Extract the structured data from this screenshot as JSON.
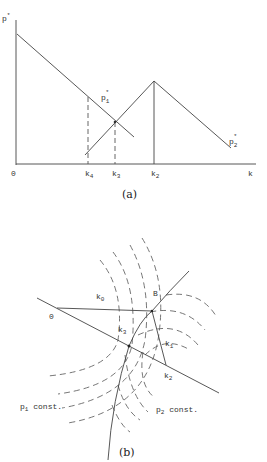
{
  "figure_a": {
    "caption": "(a)",
    "y_axis_label": "p",
    "y_axis_sup": "*",
    "origin_label": "0",
    "x_axis_label": "k",
    "curves": [
      {
        "name": "p1*",
        "label_base": "p",
        "label_sub": "1",
        "label_sup": "*"
      },
      {
        "name": "p2*",
        "label_base": "p",
        "label_sub": "2",
        "label_sup": "*"
      }
    ],
    "ticks": [
      {
        "base": "k",
        "sub": "4",
        "style": "dashed"
      },
      {
        "base": "k",
        "sub": "3",
        "style": "dashed"
      },
      {
        "base": "k",
        "sub": "2",
        "style": "solid"
      }
    ]
  },
  "figure_b": {
    "caption": "(b)",
    "point_o": "0",
    "point_b": "B",
    "k0": {
      "base": "k",
      "sub": "0"
    },
    "k1": {
      "base": "k",
      "sub": "1"
    },
    "k2": {
      "base": "k",
      "sub": "2"
    },
    "k3": {
      "base": "k",
      "sub": "3"
    },
    "p1_const": {
      "base": "p",
      "sub": "1",
      "text": " const."
    },
    "p2_const": {
      "base": "p",
      "sub": "2",
      "text": " const."
    }
  }
}
